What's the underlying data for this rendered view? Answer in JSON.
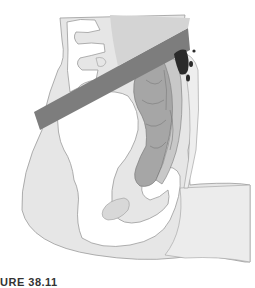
{
  "figure": {
    "caption_fragment": "URE 38.11"
  },
  "colors": {
    "background": "#ffffff",
    "soft_tissue": "#e6e6e6",
    "bone": "#ffffff",
    "bone_outline": "#9a9a9a",
    "band": "#7d7d7d",
    "band_top": "#d0d0d0",
    "colon_dark": "#a0a0a0",
    "colon_light": "#c4c4c4",
    "fluid": "#2b2b2b",
    "outline": "#8c8c8c"
  }
}
